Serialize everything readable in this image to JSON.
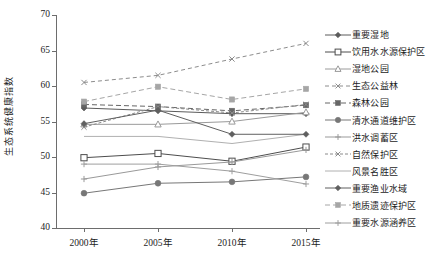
{
  "chart_data": {
    "type": "line",
    "title": "",
    "xlabel": "",
    "ylabel": "生态系统健康指数",
    "categories": [
      "2000年",
      "2005年",
      "2010年",
      "2015年"
    ],
    "ylim": [
      40,
      70
    ],
    "yticks": [
      40,
      45,
      50,
      55,
      60,
      65,
      70
    ],
    "grid": false,
    "legend_position": "right",
    "series": [
      {
        "name": "重要湿地",
        "values": [
          56.9,
          56.5,
          56.1,
          56.1
        ],
        "color": "#5b5b5b",
        "marker": "diamond",
        "dash": "none"
      },
      {
        "name": "饮用水水源保护区",
        "values": [
          49.9,
          50.5,
          49.4,
          51.4
        ],
        "color": "#4d4d4d",
        "marker": "square-open",
        "dash": "none"
      },
      {
        "name": "湿地公园",
        "values": [
          54.6,
          54.6,
          55.0,
          56.3
        ],
        "color": "#9a9a9a",
        "marker": "triangle-open",
        "dash": "none"
      },
      {
        "name": "生态公益林",
        "values": [
          60.5,
          61.5,
          63.8,
          66.0
        ],
        "color": "#8c8c8c",
        "marker": "x",
        "dash": "4,3"
      },
      {
        "name": "森林公园",
        "values": [
          57.4,
          57.1,
          56.5,
          57.3
        ],
        "color": "#666666",
        "marker": "square",
        "dash": "5,3"
      },
      {
        "name": "清水通道维护区",
        "values": [
          44.9,
          46.3,
          46.5,
          47.2
        ],
        "color": "#777777",
        "marker": "circle",
        "dash": "none"
      },
      {
        "name": "洪水调蓄区",
        "values": [
          46.9,
          48.6,
          49.3,
          51.0
        ],
        "color": "#999999",
        "marker": "plus",
        "dash": "none"
      },
      {
        "name": "自然保护区",
        "values": [
          54.2,
          57.1,
          56.2,
          57.4
        ],
        "color": "#8a8a8a",
        "marker": "x",
        "dash": "3,2"
      },
      {
        "name": "风景名胜区",
        "values": [
          52.9,
          52.9,
          51.9,
          53.2
        ],
        "color": "#b0b0b0",
        "marker": "none",
        "dash": "none"
      },
      {
        "name": "重要渔业水域",
        "values": [
          54.7,
          56.6,
          53.2,
          53.2
        ],
        "color": "#5f5f5f",
        "marker": "diamond",
        "dash": "none"
      },
      {
        "name": "地质遗迹保护区",
        "values": [
          57.8,
          59.9,
          58.1,
          59.6
        ],
        "color": "#a6a6a6",
        "marker": "square",
        "dash": "5,3"
      },
      {
        "name": "重要水源涵养区",
        "values": [
          49.0,
          49.0,
          48.0,
          46.2
        ],
        "color": "#9e9e9e",
        "marker": "plus",
        "dash": "none"
      }
    ]
  },
  "axis": {
    "y_tick_labels": [
      "40",
      "45",
      "50",
      "55",
      "60",
      "65",
      "70"
    ],
    "x_tick_labels": [
      "2000年",
      "2005年",
      "2010年",
      "2015年"
    ]
  }
}
